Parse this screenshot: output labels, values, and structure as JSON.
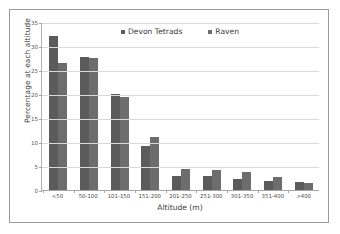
{
  "chart_data": {
    "type": "bar",
    "title": "",
    "xlabel": "Altitude (m)",
    "ylabel": "Percentage at each altitude",
    "categories": [
      "<50",
      "50-100",
      "101-150",
      "151-200",
      "201-250",
      "251-300",
      "301-350",
      "351-400",
      ">400"
    ],
    "series": [
      {
        "name": "Devon Tetrads",
        "color": "#5b5b5b",
        "values": [
          32.0,
          27.7,
          20.0,
          9.1,
          2.9,
          2.9,
          2.3,
          1.9,
          1.7
        ]
      },
      {
        "name": "Raven",
        "color": "#6d6d6d",
        "values": [
          26.5,
          27.5,
          19.3,
          11.0,
          4.4,
          4.2,
          3.7,
          2.7,
          1.5
        ]
      }
    ],
    "ylim": [
      0,
      35
    ],
    "yticks": [
      0,
      5,
      10,
      15,
      20,
      25,
      30,
      35
    ],
    "ytick_labels": [
      "0",
      "5",
      "10",
      "15",
      "20",
      "25",
      "30",
      "35"
    ],
    "grid": true,
    "legend_position": "top-center"
  },
  "colors": {
    "series_devon": "#5b5b5b",
    "series_raven": "#6d6d6d",
    "gridline": "#d9d9d9",
    "axis": "#a5a5a5",
    "frame_border": "#9a9a9a",
    "background": "#ffffff",
    "text": "#3b3b3b"
  }
}
